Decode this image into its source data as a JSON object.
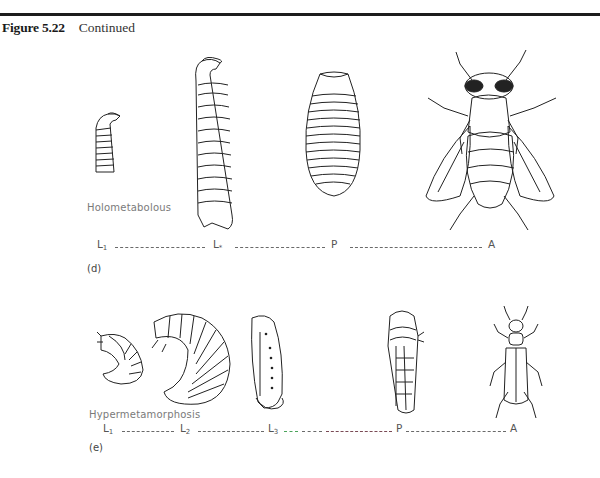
{
  "figure": {
    "number": "Figure 5.22",
    "caption_suffix": "Continued"
  },
  "panels": [
    {
      "id": "d",
      "label": "(d)",
      "type_label": "Holometabolous",
      "stages": [
        {
          "symbol": "L",
          "subscript": "1",
          "name": "first-instar larva"
        },
        {
          "symbol": "L",
          "subscript": "*",
          "name": "last-instar larva"
        },
        {
          "symbol": "P",
          "subscript": "",
          "name": "pupa"
        },
        {
          "symbol": "A",
          "subscript": "",
          "name": "adult"
        }
      ],
      "illustrations": [
        "small maggot larva",
        "large maggot larva",
        "puparium",
        "adult fly"
      ]
    },
    {
      "id": "e",
      "label": "(e)",
      "type_label": "Hypermetamorphosis",
      "stages": [
        {
          "symbol": "L",
          "subscript": "1",
          "name": "first larval form"
        },
        {
          "symbol": "L",
          "subscript": "2",
          "name": "second larval form"
        },
        {
          "symbol": "L",
          "subscript": "3",
          "name": "third larval form"
        },
        {
          "symbol": "P",
          "subscript": "",
          "name": "pupa"
        },
        {
          "symbol": "A",
          "subscript": "",
          "name": "adult"
        }
      ],
      "illustrations": [
        "small curled grub",
        "large curled grub",
        "coarctate larva",
        "pupa",
        "adult blister beetle"
      ]
    }
  ],
  "colors": {
    "rule": "#1c1c1c",
    "line_dash": "#6a6a6a",
    "accent_green": "#4aa35a",
    "accent_maroon": "#7a4a55"
  }
}
